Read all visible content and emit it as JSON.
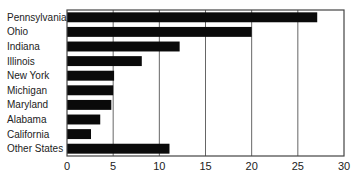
{
  "chart_data": {
    "type": "bar",
    "orientation": "horizontal",
    "title": "",
    "xlabel": "",
    "ylabel": "",
    "categories": [
      "Pennsylvania",
      "Ohio",
      "Indiana",
      "Illinois",
      "New York",
      "Michigan",
      "Maryland",
      "Alabama",
      "California",
      "Other States"
    ],
    "values": [
      27.1,
      20.0,
      12.2,
      8.1,
      5.1,
      5.0,
      4.8,
      3.6,
      2.6,
      11.1
    ],
    "xlim": [
      0,
      30
    ],
    "xticks": [
      0,
      5,
      10,
      15,
      20,
      25,
      30
    ],
    "xtick_labels": [
      "0",
      "5",
      "10",
      "15",
      "20",
      "25",
      "30"
    ],
    "grid": "vertical",
    "legend": "none",
    "bar_color": "#0a0a0a"
  }
}
